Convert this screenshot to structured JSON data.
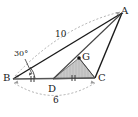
{
  "figure": {
    "background_color": "#ffffff",
    "stroke_color": "#1a1a1a",
    "dash_color": "#8c8c8c",
    "shade_fill": "#c9c9c9",
    "shade_stroke": "#6e6e6e"
  },
  "vertices": {
    "A": {
      "label": "A",
      "x": 122,
      "y": 13
    },
    "B": {
      "label": "B",
      "x": 13,
      "y": 79
    },
    "C": {
      "label": "C",
      "x": 95,
      "y": 78
    },
    "D": {
      "label": "D",
      "x": 53,
      "y": 79
    },
    "G": {
      "label": "G",
      "x": 79,
      "y": 58
    }
  },
  "measures": {
    "side_ba": {
      "label": "10",
      "from": "B",
      "to": "A",
      "style": "dashed-arc-above"
    },
    "side_bc": {
      "label": "6",
      "from": "B",
      "to": "C",
      "style": "dashed-arc-below"
    },
    "angle_b": {
      "label": "30°",
      "at": "B",
      "style": "arc-with-leader"
    }
  },
  "marks": {
    "congruent_segments": [
      {
        "segment": "BD",
        "ticks": 2
      },
      {
        "segment": "DC",
        "ticks": 2
      }
    ]
  },
  "shaded_region": {
    "name": "triangle-DGC",
    "vertices": [
      "D",
      "G",
      "C"
    ],
    "hatch": "vertical"
  },
  "segments": [
    {
      "from": "B",
      "to": "A",
      "style": "solid"
    },
    {
      "from": "B",
      "to": "C",
      "style": "solid"
    },
    {
      "from": "A",
      "to": "C",
      "style": "solid"
    },
    {
      "from": "A",
      "to": "D",
      "style": "solid"
    },
    {
      "from": "G",
      "to": "C",
      "style": "solid"
    },
    {
      "from": "D",
      "to": "C",
      "style": "solid"
    }
  ]
}
